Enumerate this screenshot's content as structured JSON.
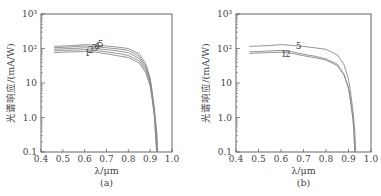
{
  "chart_data": [
    {
      "type": "line",
      "panel_label": "(a)",
      "xlabel": "λ/μm",
      "ylabel": "光谱响应/(mA/W)",
      "xlim": [
        0.4,
        1.0
      ],
      "ylim": [
        0.1,
        1000
      ],
      "yscale": "log",
      "x_ticks": [
        "0.4",
        "0.5",
        "0.6",
        "0.7",
        "0.8",
        "0.9",
        "1.0"
      ],
      "y_ticks": [
        "0.1",
        "1.0",
        "10",
        "10²",
        "10³"
      ],
      "grid": false,
      "curve_labels": [
        "1",
        "2",
        "3",
        "4",
        "5"
      ],
      "series": [
        {
          "name": "1",
          "x": [
            0.46,
            0.5,
            0.55,
            0.6,
            0.65,
            0.7,
            0.75,
            0.8,
            0.85,
            0.88,
            0.9,
            0.91,
            0.92,
            0.925,
            0.93
          ],
          "y": [
            75,
            78,
            80,
            82,
            78,
            70,
            62,
            55,
            38,
            20,
            8,
            3,
            1.0,
            0.3,
            0.1
          ]
        },
        {
          "name": "2",
          "x": [
            0.46,
            0.5,
            0.55,
            0.6,
            0.65,
            0.7,
            0.75,
            0.8,
            0.85,
            0.88,
            0.9,
            0.91,
            0.92,
            0.925,
            0.93
          ],
          "y": [
            85,
            88,
            90,
            92,
            88,
            80,
            72,
            63,
            44,
            23,
            9,
            3.5,
            1.1,
            0.3,
            0.1
          ]
        },
        {
          "name": "3",
          "x": [
            0.46,
            0.5,
            0.55,
            0.6,
            0.65,
            0.7,
            0.75,
            0.8,
            0.85,
            0.88,
            0.9,
            0.91,
            0.92,
            0.927,
            0.932
          ],
          "y": [
            95,
            98,
            100,
            105,
            100,
            92,
            85,
            75,
            52,
            27,
            11,
            4,
            1.2,
            0.35,
            0.1
          ]
        },
        {
          "name": "4",
          "x": [
            0.46,
            0.5,
            0.55,
            0.6,
            0.65,
            0.7,
            0.75,
            0.8,
            0.85,
            0.88,
            0.9,
            0.91,
            0.92,
            0.928,
            0.933
          ],
          "y": [
            105,
            108,
            112,
            118,
            112,
            105,
            98,
            88,
            60,
            31,
            12,
            4.5,
            1.4,
            0.4,
            0.1
          ]
        },
        {
          "name": "5",
          "x": [
            0.46,
            0.5,
            0.55,
            0.6,
            0.65,
            0.7,
            0.75,
            0.8,
            0.85,
            0.88,
            0.9,
            0.91,
            0.92,
            0.93,
            0.935
          ],
          "y": [
            115,
            118,
            122,
            130,
            125,
            118,
            110,
            100,
            70,
            36,
            14,
            5,
            1.6,
            0.4,
            0.1
          ]
        }
      ]
    },
    {
      "type": "line",
      "panel_label": "(b)",
      "xlabel": "λ/μm",
      "ylabel": "光谱响应/(mA/W)",
      "xlim": [
        0.4,
        1.0
      ],
      "ylim": [
        0.1,
        1000
      ],
      "yscale": "log",
      "x_ticks": [
        "0.4",
        "0.5",
        "0.6",
        "0.7",
        "0.8",
        "0.9",
        "1.0"
      ],
      "y_ticks": [
        "0.1",
        "1.0",
        "10",
        "10²",
        "10³"
      ],
      "grid": false,
      "curve_labels": [
        "1",
        "2",
        "5"
      ],
      "series": [
        {
          "name": "1",
          "x": [
            0.46,
            0.5,
            0.55,
            0.6,
            0.65,
            0.7,
            0.75,
            0.8,
            0.85,
            0.88,
            0.9,
            0.91,
            0.92,
            0.925,
            0.928
          ],
          "y": [
            72,
            74,
            76,
            78,
            72,
            62,
            54,
            46,
            32,
            17,
            7,
            2.6,
            0.9,
            0.3,
            0.1
          ]
        },
        {
          "name": "2",
          "x": [
            0.46,
            0.5,
            0.55,
            0.6,
            0.65,
            0.7,
            0.75,
            0.8,
            0.85,
            0.88,
            0.9,
            0.91,
            0.92,
            0.925,
            0.928
          ],
          "y": [
            80,
            82,
            85,
            88,
            80,
            68,
            60,
            50,
            35,
            18,
            7.5,
            2.8,
            0.95,
            0.3,
            0.1
          ]
        },
        {
          "name": "5",
          "x": [
            0.46,
            0.5,
            0.55,
            0.6,
            0.65,
            0.7,
            0.75,
            0.8,
            0.85,
            0.88,
            0.9,
            0.91,
            0.92,
            0.928,
            0.932
          ],
          "y": [
            115,
            118,
            122,
            130,
            122,
            115,
            105,
            95,
            65,
            34,
            13,
            4.8,
            1.5,
            0.4,
            0.1
          ]
        }
      ]
    }
  ],
  "panels": [
    {
      "caption": "(a)",
      "xlabel": "λ/μm",
      "ylabel": "光谱响应/(mA/W)",
      "inline_labels": [
        {
          "text": "1",
          "x": 0.6,
          "y": 62
        },
        {
          "text": "2",
          "x": 0.615,
          "y": 72
        },
        {
          "text": "3",
          "x": 0.632,
          "y": 85
        },
        {
          "text": "4",
          "x": 0.645,
          "y": 95
        },
        {
          "text": "5",
          "x": 0.66,
          "y": 108
        }
      ]
    },
    {
      "caption": "(b)",
      "xlabel": "λ/μm",
      "ylabel": "光谱响应/(mA/W)",
      "inline_labels": [
        {
          "text": "1",
          "x": 0.6,
          "y": 55
        },
        {
          "text": "2",
          "x": 0.618,
          "y": 58
        },
        {
          "text": "5",
          "x": 0.665,
          "y": 95
        }
      ]
    }
  ],
  "style": {
    "axis_color": "#555555",
    "line_color": "#8a8a8a",
    "text_color": "#444444"
  }
}
